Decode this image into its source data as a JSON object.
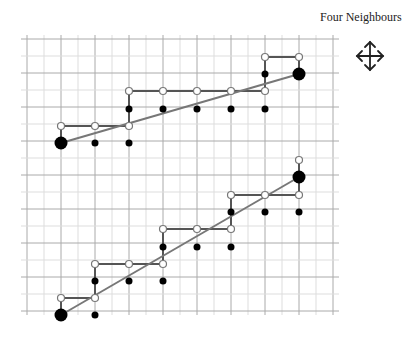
{
  "title": "Four Neighbours",
  "icon": "four-way-arrows-icon",
  "grid": {
    "x0": 27,
    "y0": 39,
    "step": 17,
    "cols": 18,
    "rows": 16,
    "minor_color": "#dddddd",
    "major_color": "#aaaaaa"
  },
  "colors": {
    "path": "#555555",
    "line": "#777777",
    "dot": "#000000",
    "open_fill": "#ffffff",
    "open_stroke": "#777777"
  },
  "paths": [
    {
      "name": "upper",
      "line": [
        [
          61,
          143
        ],
        [
          299,
          74
        ]
      ],
      "staircase": [
        [
          61,
          143
        ],
        [
          61,
          126
        ],
        [
          129,
          126
        ],
        [
          129,
          91
        ],
        [
          265,
          91
        ],
        [
          265,
          57
        ],
        [
          299,
          57
        ],
        [
          299,
          74
        ]
      ],
      "open": [
        [
          61,
          126
        ],
        [
          95,
          126
        ],
        [
          129,
          126
        ],
        [
          129,
          91
        ],
        [
          163,
          91
        ],
        [
          197,
          91
        ],
        [
          231,
          91
        ],
        [
          265,
          91
        ],
        [
          265,
          57
        ],
        [
          299,
          57
        ]
      ],
      "filled": [
        [
          95,
          143
        ],
        [
          129,
          143
        ],
        [
          129,
          109
        ],
        [
          163,
          109
        ],
        [
          197,
          109
        ],
        [
          231,
          109
        ],
        [
          265,
          109
        ],
        [
          265,
          74
        ]
      ],
      "endpoints": [
        [
          61,
          143
        ],
        [
          299,
          74
        ]
      ]
    },
    {
      "name": "lower",
      "line": [
        [
          61,
          315
        ],
        [
          299,
          177
        ]
      ],
      "staircase": [
        [
          61,
          315
        ],
        [
          61,
          298
        ],
        [
          95,
          298
        ],
        [
          95,
          264
        ],
        [
          163,
          264
        ],
        [
          163,
          229
        ],
        [
          231,
          229
        ],
        [
          231,
          195
        ],
        [
          299,
          195
        ],
        [
          299,
          160
        ]
      ],
      "open": [
        [
          61,
          298
        ],
        [
          95,
          298
        ],
        [
          95,
          264
        ],
        [
          129,
          264
        ],
        [
          163,
          264
        ],
        [
          163,
          229
        ],
        [
          197,
          229
        ],
        [
          231,
          229
        ],
        [
          231,
          195
        ],
        [
          265,
          195
        ],
        [
          299,
          195
        ],
        [
          299,
          160
        ]
      ],
      "filled": [
        [
          95,
          315
        ],
        [
          95,
          281
        ],
        [
          129,
          281
        ],
        [
          163,
          281
        ],
        [
          163,
          247
        ],
        [
          197,
          247
        ],
        [
          231,
          247
        ],
        [
          231,
          212
        ],
        [
          265,
          212
        ],
        [
          299,
          212
        ]
      ],
      "endpoints": [
        [
          61,
          315
        ],
        [
          299,
          177
        ]
      ]
    }
  ]
}
